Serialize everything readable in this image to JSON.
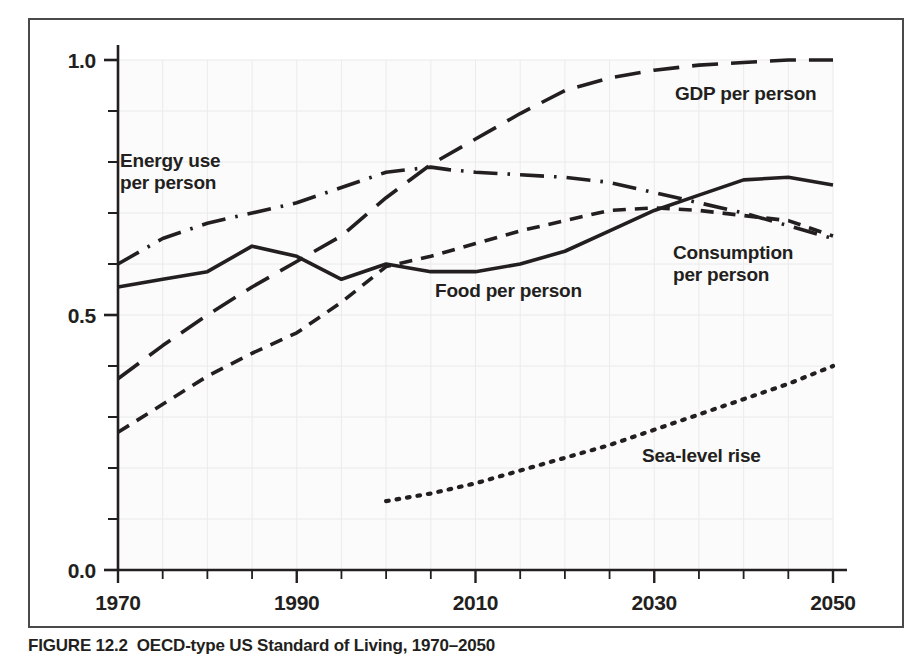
{
  "figure": {
    "caption_number": "FIGURE 12.2",
    "caption_text": "OECD-type US Standard of Living, 1970–2050"
  },
  "axes": {
    "x_ticks": [
      "1970",
      "1990",
      "2010",
      "2030",
      "2050"
    ],
    "y_ticks": [
      "0.0",
      "0.5",
      "1.0"
    ],
    "x_min": 1970,
    "x_max": 2050,
    "y_min": 0.0,
    "y_max": 1.0,
    "x_minor_step": 5,
    "y_minor_step": 0.1,
    "grid": "faint"
  },
  "series_labels": {
    "energy": "Energy use\nper person",
    "gdp": "GDP per person",
    "food": "Food per person",
    "consumption": "Consumption\nper person",
    "sea_level": "Sea-level rise"
  },
  "colors": {
    "ink": "#231f20",
    "frame": "#4a4a4a",
    "grid": "#eceaea",
    "plot_bg": "#fbfbfb"
  },
  "chart_data": {
    "type": "line",
    "title": "OECD-type US Standard of Living, 1970–2050",
    "xlabel": "",
    "ylabel": "",
    "xlim": [
      1970,
      2050
    ],
    "ylim": [
      0.0,
      1.0
    ],
    "grid": true,
    "legend": "inline-annotations",
    "x": [
      1970,
      1975,
      1980,
      1985,
      1990,
      1995,
      2000,
      2005,
      2007,
      2010,
      2015,
      2020,
      2025,
      2030,
      2035,
      2040,
      2045,
      2050
    ],
    "series": [
      {
        "name": "Energy use per person",
        "style": "dash-dot",
        "x": [
          1970,
          1975,
          1980,
          1985,
          1990,
          1995,
          2000,
          2005,
          2007,
          2010,
          2015,
          2020,
          2025,
          2030,
          2035,
          2040,
          2045,
          2050
        ],
        "values": [
          0.6,
          0.65,
          0.68,
          0.7,
          0.72,
          0.75,
          0.78,
          0.79,
          0.785,
          0.78,
          0.775,
          0.77,
          0.76,
          0.74,
          0.72,
          0.7,
          0.675,
          0.65
        ]
      },
      {
        "name": "GDP per person",
        "style": "long-dash",
        "x": [
          1970,
          1975,
          1980,
          1985,
          1990,
          1995,
          2000,
          2005,
          2010,
          2015,
          2020,
          2025,
          2030,
          2035,
          2040,
          2045,
          2050
        ],
        "values": [
          0.375,
          0.44,
          0.5,
          0.555,
          0.605,
          0.655,
          0.73,
          0.795,
          0.845,
          0.895,
          0.94,
          0.965,
          0.98,
          0.99,
          0.995,
          1.0,
          1.0
        ]
      },
      {
        "name": "Food per person",
        "style": "solid",
        "x": [
          1970,
          1975,
          1980,
          1985,
          1990,
          1995,
          2000,
          2005,
          2010,
          2015,
          2020,
          2025,
          2030,
          2035,
          2040,
          2045,
          2050
        ],
        "values": [
          0.555,
          0.57,
          0.585,
          0.635,
          0.615,
          0.57,
          0.6,
          0.585,
          0.585,
          0.6,
          0.625,
          0.665,
          0.705,
          0.735,
          0.765,
          0.77,
          0.755
        ]
      },
      {
        "name": "Consumption per person",
        "style": "short-dash",
        "x": [
          1970,
          1975,
          1980,
          1985,
          1990,
          1995,
          2000,
          2005,
          2010,
          2015,
          2020,
          2025,
          2030,
          2035,
          2040,
          2045,
          2050
        ],
        "values": [
          0.27,
          0.325,
          0.38,
          0.425,
          0.465,
          0.525,
          0.595,
          0.615,
          0.64,
          0.665,
          0.685,
          0.705,
          0.71,
          0.705,
          0.695,
          0.685,
          0.655
        ]
      },
      {
        "name": "Sea-level rise",
        "style": "dotted",
        "x": [
          2000,
          2005,
          2010,
          2015,
          2020,
          2025,
          2030,
          2035,
          2040,
          2045,
          2050
        ],
        "values": [
          0.135,
          0.15,
          0.17,
          0.195,
          0.22,
          0.245,
          0.275,
          0.305,
          0.335,
          0.365,
          0.4
        ]
      }
    ]
  }
}
